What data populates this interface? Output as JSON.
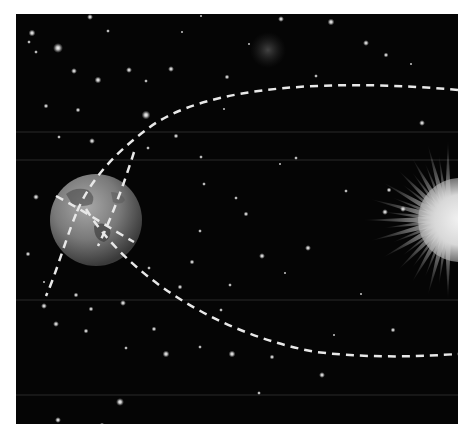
{
  "scene": {
    "description": "Earth orbiting the Sun along a dashed elliptical path against a starfield",
    "background_color": "#050505",
    "frame_color": "#ffffff",
    "orbit": {
      "style": "dashed",
      "color": "#e8e8e8"
    },
    "earth": {
      "label": "earth",
      "color": "#8a8a8a"
    },
    "sun": {
      "label": "sun",
      "color": "#e6e6e6"
    },
    "nebula": {
      "label": "faint-nebula"
    }
  }
}
